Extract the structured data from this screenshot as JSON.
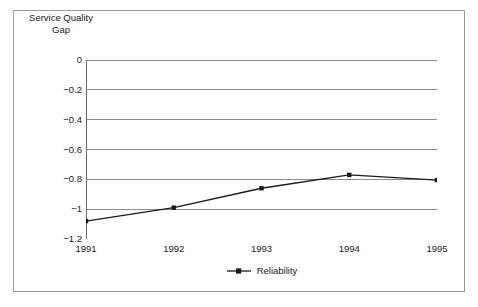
{
  "chart_data": {
    "type": "line",
    "title": "",
    "xlabel": "",
    "ylabel": "Service Quality\nGap",
    "ylabel_line1": "Service Quality",
    "ylabel_line2": "Gap",
    "categories": [
      "1991",
      "1992",
      "1993",
      "1994",
      "1995"
    ],
    "x": [
      1991,
      1992,
      1993,
      1994,
      1995
    ],
    "series": [
      {
        "name": "Reliability",
        "values": [
          -1.08,
          -0.99,
          -0.86,
          -0.77,
          -0.805
        ],
        "color": "#1a1a1a",
        "marker": "square"
      }
    ],
    "ylim": [
      -1.2,
      0
    ],
    "yticks": [
      0,
      -0.2,
      -0.4,
      -0.6,
      -0.8,
      -1,
      -1.2
    ],
    "ytick_labels": [
      "0",
      "−0.2",
      "−0.4",
      "−0.6",
      "−0.8",
      "−1",
      "−1.2"
    ],
    "xtick_labels": [
      "1991",
      "1992",
      "1993",
      "1994",
      "1995"
    ],
    "grid": "horizontal",
    "legend_position": "bottom-center",
    "legend_entries": [
      "Reliability"
    ],
    "frame_color": "#9a9a9a",
    "gridline_color": "#8c8c8c",
    "axis_color": "#6b6b6b",
    "background": "#ffffff"
  },
  "figure": {
    "border_color": "#9a9a9a",
    "background": "#ffffff"
  }
}
